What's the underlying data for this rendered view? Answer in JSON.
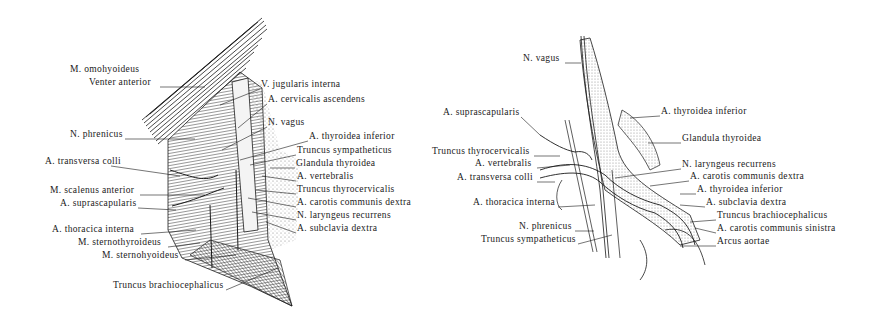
{
  "figures": [
    {
      "id": "left",
      "title": "Left neck dissection – anterior view",
      "labels": [
        {
          "text": "M. omohyoideus",
          "x": 70,
          "y": 69,
          "align": "left"
        },
        {
          "text": "Venter anterior",
          "x": 89,
          "y": 82,
          "align": "left"
        },
        {
          "text": "V. jugularis interna",
          "x": 261,
          "y": 84,
          "align": "left"
        },
        {
          "text": "A. cervicalis ascendens",
          "x": 268,
          "y": 99,
          "align": "left"
        },
        {
          "text": "N. phrenicus",
          "x": 70,
          "y": 134,
          "align": "left"
        },
        {
          "text": "N. vagus",
          "x": 268,
          "y": 122,
          "align": "left"
        },
        {
          "text": "A. thyroidea inferior",
          "x": 309,
          "y": 136,
          "align": "left"
        },
        {
          "text": "A. transversa colli",
          "x": 45,
          "y": 161,
          "align": "left"
        },
        {
          "text": "Truncus sympatheticus",
          "x": 297,
          "y": 150,
          "align": "left"
        },
        {
          "text": "Glandula thyroidea",
          "x": 296,
          "y": 163,
          "align": "left"
        },
        {
          "text": "A. vertebralis",
          "x": 297,
          "y": 176,
          "align": "left"
        },
        {
          "text": "M. scalenus anterior",
          "x": 50,
          "y": 190,
          "align": "left"
        },
        {
          "text": "Truncus thyrocervicalis",
          "x": 297,
          "y": 189,
          "align": "left"
        },
        {
          "text": "A. suprascapularis",
          "x": 60,
          "y": 203,
          "align": "left"
        },
        {
          "text": "A. carotis communis dextra",
          "x": 297,
          "y": 202,
          "align": "left"
        },
        {
          "text": "N. laryngeus recurrens",
          "x": 297,
          "y": 215,
          "align": "left"
        },
        {
          "text": "A. thoracica interna",
          "x": 52,
          "y": 229,
          "align": "left"
        },
        {
          "text": "A. subclavia dextra",
          "x": 297,
          "y": 228,
          "align": "left"
        },
        {
          "text": "M. sternothyroideus",
          "x": 78,
          "y": 242,
          "align": "left"
        },
        {
          "text": "M. sternohyoideus",
          "x": 102,
          "y": 255,
          "align": "left"
        },
        {
          "text": "Truncus brachiocephalicus",
          "x": 113,
          "y": 285,
          "align": "left"
        }
      ]
    },
    {
      "id": "right",
      "title": "Right neck schematic – recurrent laryngeal nerve",
      "labels": [
        {
          "text": "N. vagus",
          "x": 523,
          "y": 58,
          "align": "left"
        },
        {
          "text": "A. thyroidea inferior",
          "x": 661,
          "y": 111,
          "align": "left"
        },
        {
          "text": "A. suprascapularis",
          "x": 443,
          "y": 112,
          "align": "left"
        },
        {
          "text": "Glandula thyroidea",
          "x": 682,
          "y": 138,
          "align": "left"
        },
        {
          "text": "Truncus thyrocervicalis",
          "x": 432,
          "y": 151,
          "align": "left"
        },
        {
          "text": "N. laryngeus recurrens",
          "x": 682,
          "y": 164,
          "align": "left"
        },
        {
          "text": "A. vertebralis",
          "x": 475,
          "y": 163,
          "align": "left"
        },
        {
          "text": "A. carotis communis dextra",
          "x": 690,
          "y": 176,
          "align": "left"
        },
        {
          "text": "A. transversa colli",
          "x": 457,
          "y": 177,
          "align": "left"
        },
        {
          "text": "A. thyroidea inferior",
          "x": 697,
          "y": 189,
          "align": "left"
        },
        {
          "text": "A. thoracica interna",
          "x": 473,
          "y": 202,
          "align": "left"
        },
        {
          "text": "A. subclavia dextra",
          "x": 706,
          "y": 202,
          "align": "left"
        },
        {
          "text": "Truncus brachiocephalicus",
          "x": 717,
          "y": 215,
          "align": "left"
        },
        {
          "text": "N. phrenicus",
          "x": 519,
          "y": 226,
          "align": "left"
        },
        {
          "text": "A. carotis communis sinistra",
          "x": 717,
          "y": 228,
          "align": "left"
        },
        {
          "text": "Truncus sympatheticus",
          "x": 481,
          "y": 239,
          "align": "left"
        },
        {
          "text": "Arcus aortae",
          "x": 717,
          "y": 241,
          "align": "left"
        }
      ]
    }
  ],
  "colors": {
    "ink": "#1a1a1a",
    "background": "#ffffff",
    "stipple": "#8a8a8a"
  }
}
